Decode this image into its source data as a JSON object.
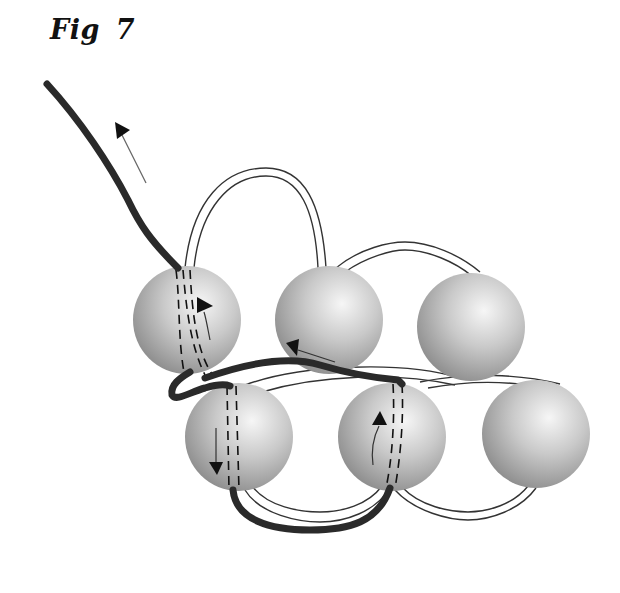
{
  "figure": {
    "title": "Fig 7"
  },
  "diagram": {
    "colors": {
      "background": "#ffffff",
      "working_thread": "#2a2a2a",
      "loop_outline": "#333333",
      "bead_light": "#f4f4f4",
      "bead_mid": "#bdbdbd",
      "bead_dark": "#8a8a8a",
      "arrow": "#111111"
    },
    "beads": [
      {
        "id": "top-left",
        "cx": 187,
        "cy": 320,
        "r": 54
      },
      {
        "id": "top-middle",
        "cx": 329,
        "cy": 320,
        "r": 54
      },
      {
        "id": "top-right",
        "cx": 471,
        "cy": 327,
        "r": 54
      },
      {
        "id": "bottom-left",
        "cx": 239,
        "cy": 437,
        "r": 54
      },
      {
        "id": "bottom-middle",
        "cx": 392,
        "cy": 437,
        "r": 54
      },
      {
        "id": "bottom-right",
        "cx": 536,
        "cy": 434,
        "r": 54
      }
    ],
    "arrows": [
      {
        "id": "exit-arrow",
        "direction": "up-left"
      },
      {
        "id": "top-left-bead-arrow",
        "direction": "up"
      },
      {
        "id": "top-middle-bead-arrow",
        "direction": "left"
      },
      {
        "id": "bottom-left-bead-arrow",
        "direction": "down"
      },
      {
        "id": "bottom-middle-bead-arrow",
        "direction": "up"
      }
    ]
  }
}
